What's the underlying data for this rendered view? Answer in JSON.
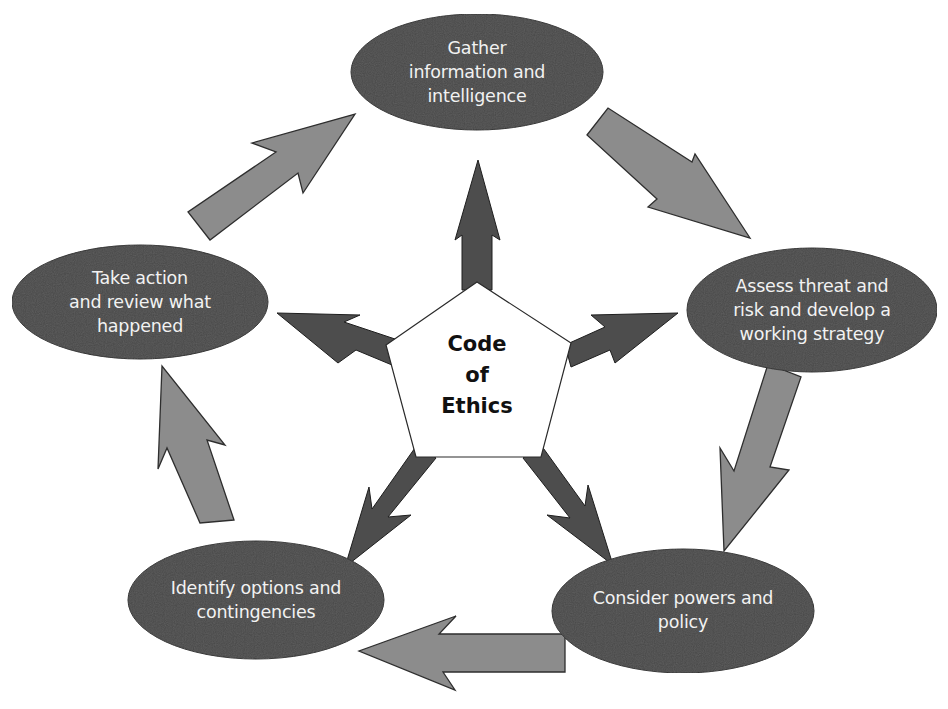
{
  "diagram": {
    "type": "cycle-with-hub",
    "center": {
      "label": "Code\nof\nEthics",
      "shape": "pentagon",
      "fill": "#ffffff"
    },
    "nodes": [
      {
        "id": "gather",
        "label": "Gather\ninformation and\nintelligence"
      },
      {
        "id": "assess",
        "label": "Assess threat and\nrisk and develop a\nworking strategy"
      },
      {
        "id": "consider",
        "label": "Consider powers and\npolicy"
      },
      {
        "id": "identify",
        "label": "Identify options and\ncontingencies"
      },
      {
        "id": "take_action",
        "label": "Take action\nand review what\nhappened"
      }
    ],
    "cycle_edges": [
      {
        "from": "gather",
        "to": "assess"
      },
      {
        "from": "assess",
        "to": "consider"
      },
      {
        "from": "consider",
        "to": "identify"
      },
      {
        "from": "identify",
        "to": "take_action"
      },
      {
        "from": "take_action",
        "to": "gather"
      }
    ],
    "hub_edges": [
      {
        "from": "center",
        "to": "gather"
      },
      {
        "from": "center",
        "to": "assess"
      },
      {
        "from": "center",
        "to": "consider"
      },
      {
        "from": "center",
        "to": "identify"
      },
      {
        "from": "center",
        "to": "take_action"
      }
    ],
    "colors": {
      "node_fill": "#4a4a4a",
      "node_text": "#f2f2f2",
      "cycle_arrow_fill": "#8c8c8c",
      "hub_arrow_fill": "#4d4d4d",
      "outline": "#2a2a2a",
      "center_text": "#111111"
    }
  }
}
